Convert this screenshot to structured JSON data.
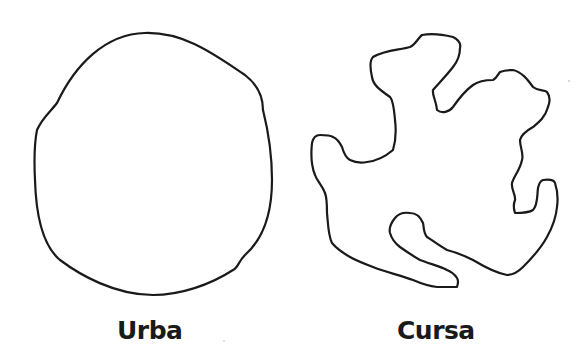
{
  "figure": {
    "shapes": [
      {
        "id": "urba",
        "label": "Urba",
        "description": "rounded blob"
      },
      {
        "id": "cursa",
        "label": "Cursa",
        "description": "jagged irregular blob"
      }
    ],
    "colors": {
      "stroke": "#1a1a1a",
      "background": "#ffffff"
    }
  }
}
